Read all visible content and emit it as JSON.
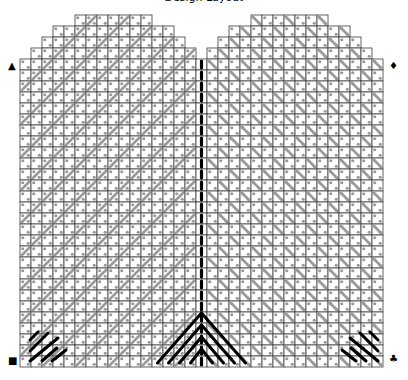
{
  "title": "Design Layout",
  "grid": {
    "origin_x": 20,
    "origin_y": 15,
    "cell": 11,
    "columns": 33,
    "rows": 32,
    "center_column": 16,
    "row_spans": [
      [
        [
          5,
          11
        ],
        [
          21,
          27
        ]
      ],
      [
        [
          3,
          13
        ],
        [
          19,
          29
        ]
      ],
      [
        [
          2,
          14
        ],
        [
          18,
          30
        ]
      ],
      [
        [
          1,
          15
        ],
        [
          17,
          31
        ]
      ],
      [
        [
          0,
          32
        ]
      ]
    ],
    "line_color": "#3a3a3a",
    "stitch_color": "#9a9a9a",
    "backstitch_color": "#000000"
  },
  "markers": {
    "top_left": "▲",
    "top_right": "♦",
    "bottom_left": "■",
    "bottom_right": "♣"
  }
}
